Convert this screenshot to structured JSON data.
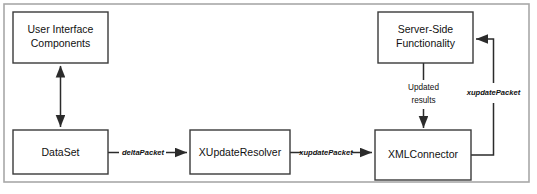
{
  "diagram": {
    "type": "flow-diagram",
    "frame": {
      "x": 4,
      "y": 4,
      "width": 525,
      "height": 178
    },
    "colors": {
      "background": "#ffffff",
      "frame_stroke": "#a8a8a8",
      "node_stroke": "#3a3a3a",
      "connector_stroke": "#2b2b2b",
      "text": "#111111"
    },
    "nodes": [
      {
        "id": "user-interface-components",
        "label_line1": "User Interface",
        "label_line2": "Components",
        "x": 13,
        "y": 12,
        "width": 95,
        "height": 51
      },
      {
        "id": "server-side-functionality",
        "label_line1": "Server-Side",
        "label_line2": "Functionality",
        "x": 378,
        "y": 12,
        "width": 95,
        "height": 51
      },
      {
        "id": "dataset",
        "label_line1": "DataSet",
        "label_line2": "",
        "x": 13,
        "y": 130,
        "width": 95,
        "height": 44
      },
      {
        "id": "xupdateresolver",
        "label_line1": "XUpdateResolver",
        "label_line2": "",
        "x": 190,
        "y": 130,
        "width": 100,
        "height": 44
      },
      {
        "id": "xmlconnector",
        "label_line1": "XMLConnector",
        "label_line2": "",
        "x": 375,
        "y": 130,
        "width": 96,
        "height": 50
      }
    ],
    "edges": [
      {
        "id": "ui-dataset",
        "from": "user-interface-components",
        "to": "dataset",
        "label": "",
        "style": "double-headed-vertical"
      },
      {
        "id": "dataset-xupdateresolver",
        "from": "dataset",
        "to": "xupdateresolver",
        "label": "deltaPacket",
        "label_style": "italic",
        "style": "horizontal-arrow"
      },
      {
        "id": "xupdateresolver-xmlconnector",
        "from": "xupdateresolver",
        "to": "xmlconnector",
        "label": "xupdatePacket",
        "label_style": "italic",
        "style": "horizontal-arrow"
      },
      {
        "id": "serverside-xmlconnector",
        "from": "server-side-functionality",
        "to": "xmlconnector",
        "label_line1": "Updated",
        "label_line2": "results",
        "label_style": "plain",
        "style": "vertical-arrow-down"
      },
      {
        "id": "xmlconnector-serverside",
        "from": "xmlconnector",
        "to": "server-side-functionality",
        "label": "xupdatePacket",
        "label_style": "italic",
        "style": "elbow-right-up-left-arrow"
      }
    ]
  }
}
